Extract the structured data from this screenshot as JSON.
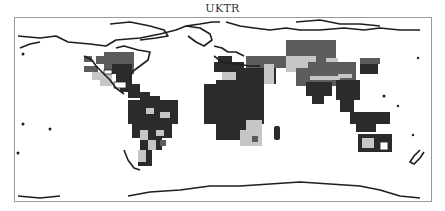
{
  "title": "UKTR",
  "colors": {
    "dark": "#2b2b2b",
    "medium": "#5c5c5c",
    "light": "#c6c6c6",
    "coast": "#1e1e1e",
    "frame": "#9a9a9a"
  },
  "map": {
    "projection": "plate-carree",
    "frame": {
      "x": 14,
      "y": 17,
      "width": 418,
      "height": 185
    },
    "legend": "none shown",
    "shading_levels": [
      "dark",
      "medium",
      "light"
    ],
    "cells": [
      {
        "x": 84,
        "y": 56,
        "w": 8,
        "h": 6,
        "c": "medium"
      },
      {
        "x": 96,
        "y": 56,
        "w": 14,
        "h": 8,
        "c": "medium"
      },
      {
        "x": 104,
        "y": 52,
        "w": 30,
        "h": 22,
        "c": "medium"
      },
      {
        "x": 84,
        "y": 66,
        "w": 14,
        "h": 6,
        "c": "medium"
      },
      {
        "x": 92,
        "y": 72,
        "w": 20,
        "h": 8,
        "c": "light"
      },
      {
        "x": 100,
        "y": 78,
        "w": 12,
        "h": 8,
        "c": "light"
      },
      {
        "x": 112,
        "y": 64,
        "w": 20,
        "h": 10,
        "c": "dark"
      },
      {
        "x": 116,
        "y": 74,
        "w": 16,
        "h": 10,
        "c": "dark"
      },
      {
        "x": 120,
        "y": 84,
        "w": 20,
        "h": 8,
        "c": "dark"
      },
      {
        "x": 128,
        "y": 92,
        "w": 22,
        "h": 6,
        "c": "dark"
      },
      {
        "x": 140,
        "y": 96,
        "w": 20,
        "h": 10,
        "c": "dark"
      },
      {
        "x": 128,
        "y": 100,
        "w": 50,
        "h": 24,
        "c": "dark"
      },
      {
        "x": 132,
        "y": 124,
        "w": 40,
        "h": 14,
        "c": "dark"
      },
      {
        "x": 140,
        "y": 138,
        "w": 22,
        "h": 12,
        "c": "dark"
      },
      {
        "x": 138,
        "y": 150,
        "w": 14,
        "h": 16,
        "c": "dark"
      },
      {
        "x": 146,
        "y": 108,
        "w": 8,
        "h": 6,
        "c": "light"
      },
      {
        "x": 160,
        "y": 112,
        "w": 10,
        "h": 6,
        "c": "light"
      },
      {
        "x": 140,
        "y": 130,
        "w": 8,
        "h": 10,
        "c": "light"
      },
      {
        "x": 148,
        "y": 140,
        "w": 8,
        "h": 10,
        "c": "light"
      },
      {
        "x": 156,
        "y": 130,
        "w": 8,
        "h": 6,
        "c": "light"
      },
      {
        "x": 138,
        "y": 150,
        "w": 8,
        "h": 12,
        "c": "light"
      },
      {
        "x": 160,
        "y": 140,
        "w": 6,
        "h": 6,
        "c": "medium"
      },
      {
        "x": 218,
        "y": 56,
        "w": 14,
        "h": 12,
        "c": "dark"
      },
      {
        "x": 214,
        "y": 62,
        "w": 30,
        "h": 10,
        "c": "dark"
      },
      {
        "x": 246,
        "y": 56,
        "w": 40,
        "h": 12,
        "c": "medium"
      },
      {
        "x": 286,
        "y": 40,
        "w": 50,
        "h": 22,
        "c": "medium"
      },
      {
        "x": 222,
        "y": 72,
        "w": 26,
        "h": 10,
        "c": "light"
      },
      {
        "x": 216,
        "y": 80,
        "w": 36,
        "h": 60,
        "c": "dark"
      },
      {
        "x": 204,
        "y": 84,
        "w": 60,
        "h": 40,
        "c": "dark"
      },
      {
        "x": 236,
        "y": 68,
        "w": 40,
        "h": 16,
        "c": "dark"
      },
      {
        "x": 264,
        "y": 64,
        "w": 10,
        "h": 20,
        "c": "light"
      },
      {
        "x": 286,
        "y": 56,
        "w": 30,
        "h": 16,
        "c": "light"
      },
      {
        "x": 246,
        "y": 120,
        "w": 16,
        "h": 26,
        "c": "light"
      },
      {
        "x": 240,
        "y": 130,
        "w": 12,
        "h": 16,
        "c": "light"
      },
      {
        "x": 252,
        "y": 136,
        "w": 6,
        "h": 6,
        "c": "medium"
      },
      {
        "x": 298,
        "y": 42,
        "w": 24,
        "h": 12,
        "c": "medium"
      },
      {
        "x": 296,
        "y": 62,
        "w": 60,
        "h": 24,
        "c": "medium"
      },
      {
        "x": 296,
        "y": 60,
        "w": 12,
        "h": 8,
        "c": "light"
      },
      {
        "x": 326,
        "y": 58,
        "w": 12,
        "h": 4,
        "c": "light"
      },
      {
        "x": 338,
        "y": 74,
        "w": 14,
        "h": 4,
        "c": "light"
      },
      {
        "x": 310,
        "y": 76,
        "w": 30,
        "h": 4,
        "c": "light"
      },
      {
        "x": 306,
        "y": 82,
        "w": 26,
        "h": 14,
        "c": "dark"
      },
      {
        "x": 312,
        "y": 96,
        "w": 12,
        "h": 8,
        "c": "dark"
      },
      {
        "x": 336,
        "y": 80,
        "w": 24,
        "h": 20,
        "c": "dark"
      },
      {
        "x": 340,
        "y": 100,
        "w": 14,
        "h": 12,
        "c": "dark"
      },
      {
        "x": 360,
        "y": 64,
        "w": 18,
        "h": 10,
        "c": "dark"
      },
      {
        "x": 360,
        "y": 58,
        "w": 20,
        "h": 6,
        "c": "medium"
      },
      {
        "x": 350,
        "y": 112,
        "w": 40,
        "h": 12,
        "c": "dark"
      },
      {
        "x": 356,
        "y": 124,
        "w": 20,
        "h": 8,
        "c": "dark"
      },
      {
        "x": 358,
        "y": 134,
        "w": 34,
        "h": 18,
        "c": "dark"
      },
      {
        "x": 362,
        "y": 138,
        "w": 12,
        "h": 10,
        "c": "light"
      },
      {
        "x": 376,
        "y": 140,
        "w": 14,
        "h": 10,
        "c": "dark"
      }
    ],
    "white_holes": [
      {
        "x": 380,
        "y": 142,
        "w": 8,
        "h": 8
      },
      {
        "x": 104,
        "y": 70,
        "w": 8,
        "h": 4
      },
      {
        "x": 114,
        "y": 82,
        "w": 12,
        "h": 6
      }
    ],
    "coastlines": [
      "M18 36 L40 38 L56 36 L68 42 L90 44 L106 46 L116 40 L140 38 L160 34 L176 30 L186 26 L200 24 L212 22 L220 22",
      "M20 48 L30 44 L40 42",
      "M110 24 L130 22 L150 26 L164 30 L168 36 L156 38 L140 40",
      "M116 48 L124 46 L138 50 L150 52 L148 60 L140 66 L132 72 L130 80",
      "M84 56 L92 60 L96 66 L104 74 L110 80 L116 88 L124 94",
      "M186 26 L200 28 L210 34 L212 40 L204 46 L196 42 L188 36",
      "M226 22 L240 26 L254 28 L270 30 L286 28 L300 30 L320 30 L344 28 L364 30 L380 28 L400 30 L420 30",
      "M296 22 L320 20 L340 24 L360 24 L380 26",
      "M214 46 L222 48 L228 52 L236 52 L244 56",
      "M214 56 L222 62 L236 64 L250 66 L260 66",
      "M124 150 L128 160 L134 168 L140 170",
      "M128 196 L150 192 L180 190 L210 186 L240 186 L270 184 L300 182 L330 184 L360 186 L380 190 L400 196 L420 198",
      "M18 196 L40 198 L60 196"
    ],
    "islands": [
      {
        "x": 23,
        "y": 54,
        "r": 1.5
      },
      {
        "x": 23,
        "y": 124,
        "r": 1.5
      },
      {
        "x": 18,
        "y": 153,
        "r": 1.5
      },
      {
        "x": 50,
        "y": 129,
        "r": 1.5
      },
      {
        "x": 384,
        "y": 96,
        "r": 1.5
      },
      {
        "x": 398,
        "y": 106,
        "r": 1.2
      },
      {
        "x": 418,
        "y": 58,
        "r": 1.2
      },
      {
        "x": 413,
        "y": 135,
        "r": 1.2
      }
    ],
    "madagascar": {
      "x": 274,
      "y": 126,
      "w": 6,
      "h": 14
    },
    "new_zealand": "M420 150 L414 156 L410 162 L414 164 L420 158 L424 152"
  }
}
